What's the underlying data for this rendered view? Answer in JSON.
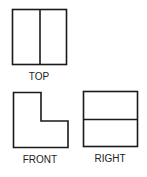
{
  "diagram": {
    "type": "orthographic-projection",
    "views": {
      "top": {
        "label": "TOP",
        "divider": "vertical"
      },
      "front": {
        "label": "FRONT",
        "shape": "L-shape"
      },
      "right": {
        "label": "RIGHT",
        "divider": "horizontal"
      }
    }
  }
}
